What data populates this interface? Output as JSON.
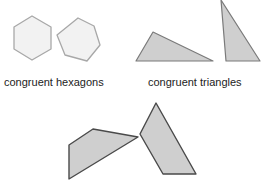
{
  "labels": {
    "hexagons": "congruent hexagons",
    "triangles": "congruent triangles"
  },
  "colors": {
    "hexagon_fill": "#f2f2f2",
    "hexagon_stroke": "#a8a8a8",
    "shape_fill": "#cfcfcf",
    "triangle_stroke": "#7a7a7a",
    "quad_stroke": "#4a4a4a"
  },
  "shapes": {
    "hexagons": [
      "32,16 51,27 51,49 32,60 14,49 14,27",
      "78,18 94,26 100,45 87,61 65,55 57,35"
    ],
    "triangles": [
      "136,61 153,32 213,61",
      "221,0 226,61 260,61"
    ],
    "quadrilaterals": [
      "69,145 93,129 138,137 69,179",
      "140,134 156,103 196,174 163,174"
    ]
  }
}
